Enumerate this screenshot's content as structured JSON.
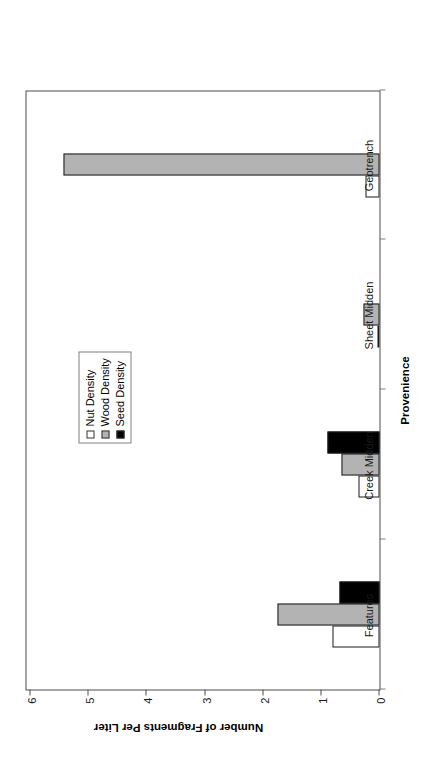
{
  "chart_data": {
    "type": "bar",
    "title": "",
    "orientation": "vertical-rendered-rotated",
    "categories": [
      "Features",
      "Creek Midden",
      "Sheet Midden",
      "Geotrench"
    ],
    "series": [
      {
        "name": "Nut Density",
        "color": "#ffffff",
        "values": [
          0.81,
          0.37,
          0.03,
          0.25
        ]
      },
      {
        "name": "Wood Density",
        "color": "#b3b3b3",
        "values": [
          1.76,
          0.66,
          0.27,
          5.44
        ]
      },
      {
        "name": "Seed Density",
        "color": "#000000",
        "values": [
          0.68,
          0.9,
          0.0,
          0.0
        ]
      }
    ],
    "xlabel": "Provenience",
    "ylabel": "Number of Fragments Per Liter",
    "ylim": [
      0,
      6
    ],
    "yticks": [
      "0",
      "1",
      "2",
      "3",
      "4",
      "5",
      "6"
    ],
    "grid": false,
    "legend_position": "center"
  },
  "axes": {
    "value_axis_title": "Number of Fragments Per Liter",
    "category_axis_title": "Provenience",
    "tick_0": "0",
    "tick_1": "1",
    "tick_2": "2",
    "tick_3": "3",
    "tick_4": "4",
    "tick_5": "5",
    "tick_6": "6"
  },
  "categories": {
    "c0": "Features",
    "c1": "Creek Midden",
    "c2": "Sheet Midden",
    "c3": "Geotrench"
  },
  "legend": {
    "items": [
      {
        "label": "Nut Density"
      },
      {
        "label": "Wood Density"
      },
      {
        "label": "Seed Density"
      }
    ]
  }
}
